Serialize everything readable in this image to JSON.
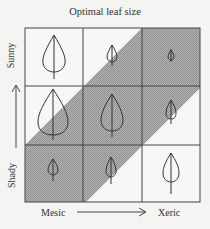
{
  "title": "Optimal leaf size",
  "axes": {
    "y_top": "Sunny",
    "y_bottom": "Shady",
    "x_left": "Mesic",
    "x_right": "Xeric"
  },
  "colors": {
    "shade": "#a8a8a6",
    "line": "#444444",
    "background": "#f4f4f2"
  },
  "grid": {
    "rows": [
      "Sunny",
      "Medium",
      "Shady"
    ],
    "cols": [
      "Mesic",
      "Medium",
      "Xeric"
    ],
    "cells": [
      [
        {
          "leaf": "large",
          "shaded": false
        },
        {
          "leaf": "small",
          "shaded": "partial"
        },
        {
          "leaf": "tiny",
          "shaded": true
        }
      ],
      [
        {
          "leaf": "very large",
          "shaded": "partial"
        },
        {
          "leaf": "very large",
          "shaded": true
        },
        {
          "leaf": "small",
          "shaded": "partial"
        }
      ],
      [
        {
          "leaf": "small",
          "shaded": true
        },
        {
          "leaf": "medium",
          "shaded": "partial"
        },
        {
          "leaf": "large",
          "shaded": false
        }
      ]
    ]
  }
}
